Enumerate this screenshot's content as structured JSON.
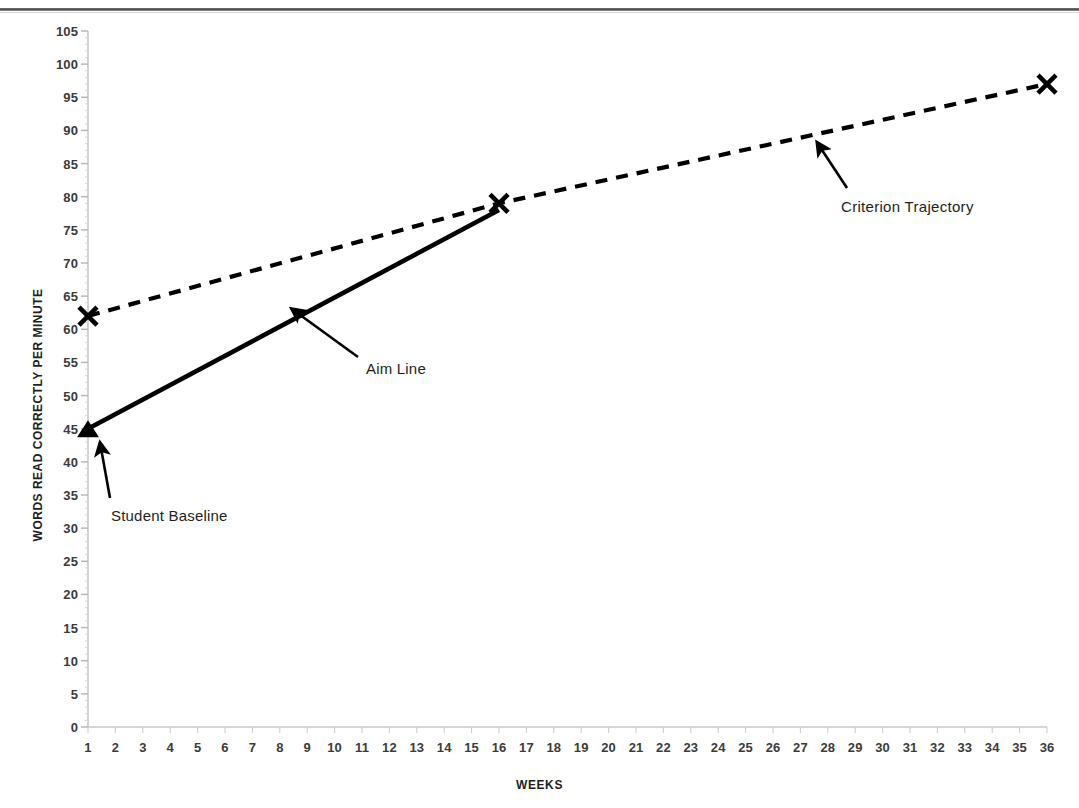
{
  "page": {
    "top_rule": "page-top-rule"
  },
  "chart_data": {
    "type": "line",
    "title": "",
    "subtitle": "",
    "xlabel": "WEEKS",
    "ylabel": "WORDS READ CORRECTLY PER MINUTE",
    "xlim": [
      1,
      36
    ],
    "ylim": [
      0,
      105
    ],
    "ytick_step": 5,
    "grid": false,
    "legend": "none (in-plot annotations)",
    "categories": [
      1,
      2,
      3,
      4,
      5,
      6,
      7,
      8,
      9,
      10,
      11,
      12,
      13,
      14,
      15,
      16,
      17,
      18,
      19,
      20,
      21,
      22,
      23,
      24,
      25,
      26,
      27,
      28,
      29,
      30,
      31,
      32,
      33,
      34,
      35,
      36
    ],
    "yticks": [
      0,
      5,
      10,
      15,
      20,
      25,
      30,
      35,
      40,
      45,
      50,
      55,
      60,
      65,
      70,
      75,
      80,
      85,
      90,
      95,
      100,
      105
    ],
    "series": [
      {
        "name": "Aim Line",
        "style": "solid",
        "color": "#000000",
        "marker": "triangle-start",
        "points": [
          {
            "x": 1,
            "y": 45
          },
          {
            "x": 16,
            "y": 78
          }
        ]
      },
      {
        "name": "Criterion Trajectory",
        "style": "dashed",
        "color": "#000000",
        "marker": "x",
        "points": [
          {
            "x": 1,
            "y": 62
          },
          {
            "x": 16,
            "y": 79
          },
          {
            "x": 36,
            "y": 97
          }
        ]
      }
    ],
    "annotations": [
      {
        "text": "Student Baseline",
        "points_to": {
          "x": 1,
          "y": 45
        },
        "arrow": "up"
      },
      {
        "text": "Aim Line",
        "points_to": {
          "x": 8.5,
          "y": 62
        },
        "arrow": "up-left"
      },
      {
        "text": "Criterion  Trajectory",
        "points_to": {
          "x": 28,
          "y": 89
        },
        "arrow": "up-left"
      }
    ]
  },
  "axis": {
    "x_title": "WEEKS",
    "y_title": "WORDS READ CORRECTLY PER MINUTE",
    "y_labels": [
      "105",
      "100",
      "95",
      "90",
      "85",
      "80",
      "75",
      "70",
      "65",
      "60",
      "55",
      "50",
      "45",
      "40",
      "35",
      "30",
      "25",
      "20",
      "15",
      "10",
      "5",
      "0"
    ],
    "x_labels": [
      "1",
      "2",
      "3",
      "4",
      "5",
      "6",
      "7",
      "8",
      "9",
      "10",
      "11",
      "12",
      "13",
      "14",
      "15",
      "16",
      "17",
      "18",
      "19",
      "20",
      "21",
      "22",
      "23",
      "24",
      "25",
      "26",
      "27",
      "28",
      "29",
      "30",
      "31",
      "32",
      "33",
      "34",
      "35",
      "36"
    ]
  },
  "annotations": {
    "student_baseline": "Student Baseline",
    "aim_line": "Aim Line",
    "criterion_trajectory": "Criterion  Trajectory"
  },
  "colors": {
    "axis": "#c9c9c9",
    "data": "#000000",
    "text": "#231f20",
    "rule": "#3a3a3a"
  }
}
